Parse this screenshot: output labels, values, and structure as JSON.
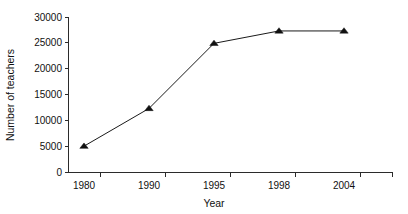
{
  "chart_data": {
    "type": "line",
    "title": "",
    "subtitle": "",
    "xlabel": "Year",
    "ylabel": "Number of teachers",
    "categories": [
      "1980",
      "1990",
      "1995",
      "1998",
      "2004"
    ],
    "values": [
      5000,
      12300,
      24900,
      27300,
      27300
    ],
    "series": [
      {
        "name": "Number of teachers",
        "values": [
          5000,
          12300,
          24900,
          27300,
          27300
        ]
      }
    ],
    "ylim": [
      0,
      30000
    ],
    "y_ticks": [
      0,
      5000,
      10000,
      15000,
      20000,
      25000,
      30000
    ],
    "y_tick_labels": [
      "0",
      "5000",
      "10000",
      "15000",
      "20000",
      "25000",
      "30000"
    ],
    "x_tick_labels": [
      "1980",
      "1990",
      "1995",
      "1998",
      "2004"
    ],
    "grid": false,
    "legend": false,
    "legend_position": "none",
    "marker": "triangle",
    "line_color": "#1a1a1a",
    "marker_color": "#111111",
    "axis_color": "#2b2b2b",
    "background": "#ffffff",
    "annotations": []
  },
  "axes": {
    "y_label": "Number of teachers",
    "x_label": "Year"
  }
}
